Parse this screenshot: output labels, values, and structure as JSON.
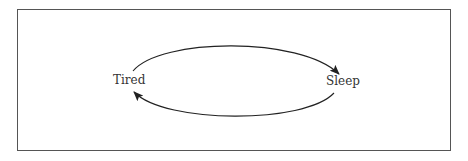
{
  "diagram": {
    "nodes": [
      {
        "id": "tired",
        "label": "Tired"
      },
      {
        "id": "sleep",
        "label": "Sleep"
      }
    ],
    "edges": [
      {
        "from": "tired",
        "to": "sleep",
        "position": "top"
      },
      {
        "from": "sleep",
        "to": "tired",
        "position": "bottom"
      }
    ],
    "colors": {
      "stroke": "#222222",
      "border": "#555555",
      "text": "#333333"
    }
  }
}
